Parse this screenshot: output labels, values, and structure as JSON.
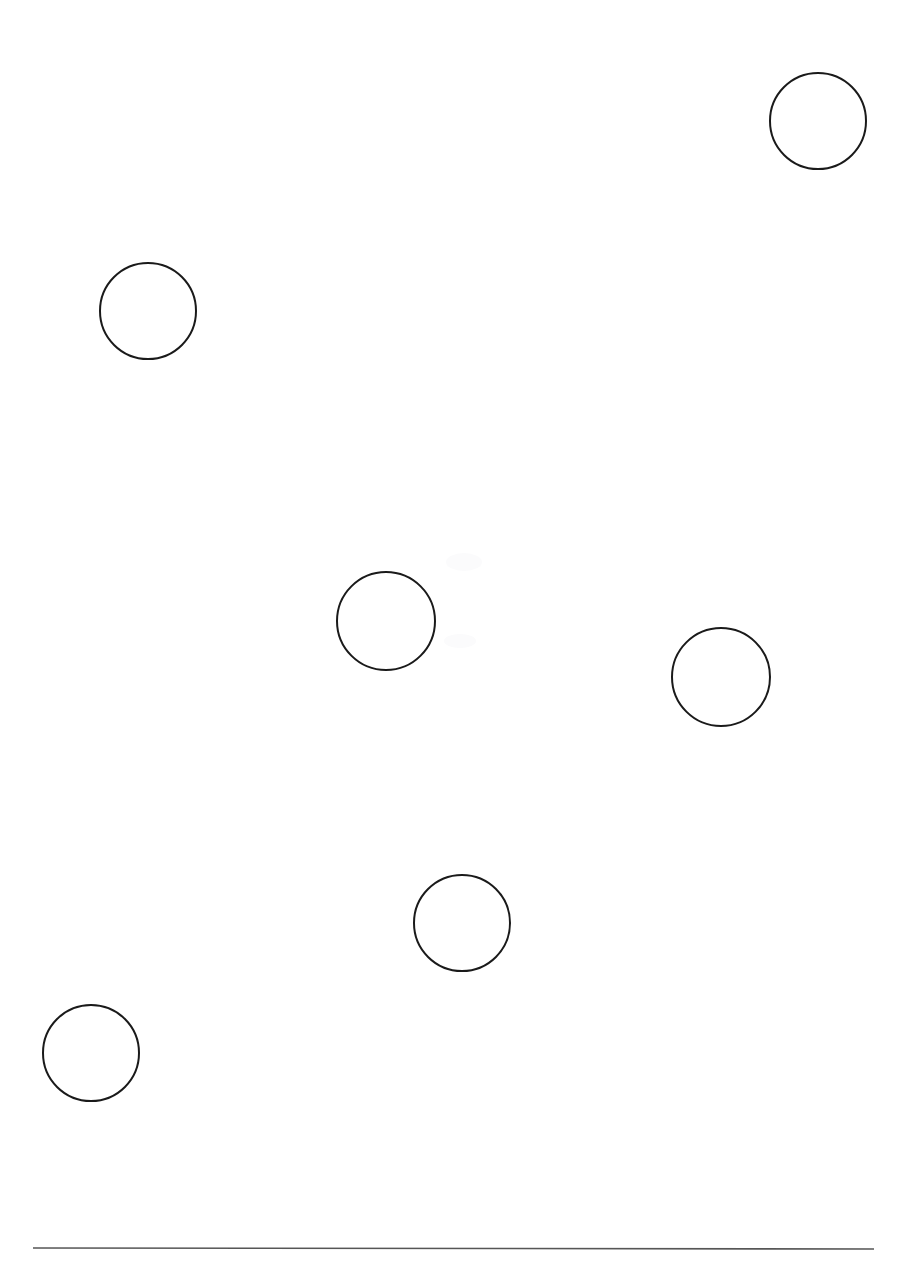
{
  "page": {
    "width": 907,
    "height": 1269,
    "background_color": "#ffffff",
    "ink_color": "#1a1a1a",
    "rule_color": "#565656"
  },
  "chart_data": {
    "type": "scatter",
    "title": "",
    "subtitle": "",
    "xlabel": "",
    "ylabel": "",
    "grid": false,
    "legend": null,
    "xlim": [
      0,
      907
    ],
    "ylim": [
      0,
      1269
    ],
    "marker": "open-circle",
    "marker_stroke_color": "#1a1a1a",
    "marker_stroke_width": 2,
    "marker_fill": "none",
    "point_count": 6,
    "points": [
      {
        "id": "circle-1",
        "label": "top-right circle",
        "cx": 818,
        "cy": 121,
        "r": 48
      },
      {
        "id": "circle-2",
        "label": "upper-left circle",
        "cx": 148,
        "cy": 311,
        "r": 48
      },
      {
        "id": "circle-3",
        "label": "middle-left circle",
        "cx": 386,
        "cy": 621,
        "r": 49
      },
      {
        "id": "circle-4",
        "label": "middle-right circle",
        "cx": 721,
        "cy": 677,
        "r": 49
      },
      {
        "id": "circle-5",
        "label": "lower-middle circle",
        "cx": 462,
        "cy": 923,
        "r": 48
      },
      {
        "id": "circle-6",
        "label": "bottom-left circle",
        "cx": 91,
        "cy": 1053,
        "r": 48
      }
    ]
  },
  "annotations": {
    "horizontal_rule": {
      "label": "footer separator rule",
      "x1": 33,
      "y1": 1248,
      "x2": 874,
      "y2": 1249,
      "stroke_width": 1.6,
      "color": "#565656"
    },
    "faint_marks": [
      {
        "id": "faint-mark-1",
        "cx": 464,
        "cy": 562,
        "rx": 18,
        "ry": 9
      },
      {
        "id": "faint-mark-2",
        "cx": 460,
        "cy": 641,
        "rx": 16,
        "ry": 7
      }
    ]
  }
}
